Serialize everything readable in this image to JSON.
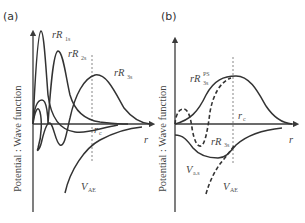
{
  "figure": {
    "panels": [
      {
        "id": "a",
        "label": "(a)",
        "ylabel": "Potential : Wave function",
        "xlabel": "r",
        "cutoff_label": "r",
        "cutoff_sub": "c",
        "curves": [
          {
            "name": "rR",
            "sub": "1s",
            "style": "solid"
          },
          {
            "name": "rR",
            "sub": "2s",
            "style": "solid"
          },
          {
            "name": "rR",
            "sub": "3s",
            "style": "solid"
          },
          {
            "name": "V",
            "sub": "AE",
            "style": "solid"
          }
        ]
      },
      {
        "id": "b",
        "label": "(b)",
        "ylabel": "Potential : Wave function",
        "xlabel": "r",
        "cutoff_label": "r",
        "cutoff_sub": "c",
        "curves": [
          {
            "name": "rR",
            "sub": "3s",
            "sup": "PS",
            "style": "solid"
          },
          {
            "name": "rR",
            "sub": "3s",
            "style": "dashed"
          },
          {
            "name": "V",
            "sub": "a.s",
            "style": "solid"
          },
          {
            "name": "V",
            "sub": "AE",
            "style": "dashed"
          }
        ]
      }
    ]
  }
}
